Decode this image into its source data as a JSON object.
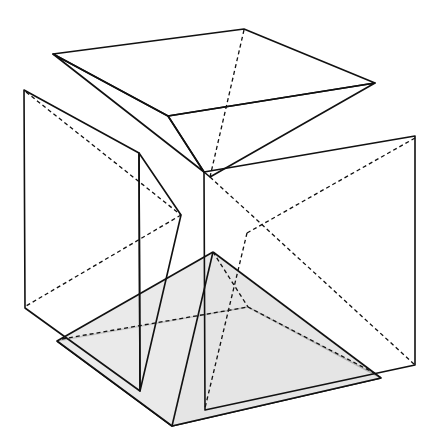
{
  "figure": {
    "colors": {
      "background": "#ffffff",
      "light_fill": "#e3e3e3",
      "panel_fill": "#b6b6b6",
      "wedge_fill": "#a0a0a0",
      "base_fill": "#dcdcdc",
      "stroke": "#111111"
    },
    "parts": [
      {
        "name": "top-pyramid",
        "vertices": [
          [
            53,
            54
          ],
          [
            244,
            29
          ],
          [
            375,
            83
          ],
          [
            168,
            116
          ]
        ],
        "apex": [
          204,
          172
        ]
      },
      {
        "name": "left-panel",
        "vertices": [
          [
            24,
            90
          ],
          [
            139,
            153
          ],
          [
            140,
            391
          ],
          [
            25,
            308
          ]
        ]
      },
      {
        "name": "left-wedge",
        "vertices": [
          [
            139,
            153
          ],
          [
            181,
            215
          ],
          [
            140,
            391
          ]
        ]
      },
      {
        "name": "right-panel",
        "vertices": [
          [
            204,
            172
          ],
          [
            415,
            136
          ],
          [
            415,
            365
          ],
          [
            205,
            410
          ]
        ],
        "center": [
          247,
          233
        ]
      },
      {
        "name": "bottom-pyramid",
        "base": [
          [
            57,
            341
          ],
          [
            248,
            307
          ],
          [
            381,
            378
          ],
          [
            172,
            426
          ]
        ],
        "apex": [
          213,
          252
        ]
      }
    ]
  }
}
